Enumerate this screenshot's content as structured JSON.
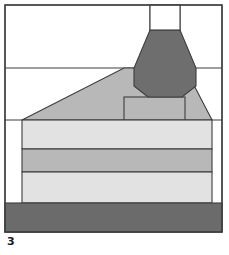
{
  "figure": {
    "label": "3",
    "caption_label": "3",
    "type": "cross-section-schematic",
    "width": 229,
    "height": 255,
    "background_color": "#ffffff"
  },
  "colors": {
    "stroke": "#3d3d3d",
    "core_dark": "#6e6e6e",
    "mid_gray": "#b8b8b8",
    "light_gray": "#e2e2e2",
    "base_dark": "#6b6b6b",
    "white": "#ffffff",
    "label_text": "#1a1a1a"
  },
  "frame": {
    "name": "outer-frame",
    "x": 5,
    "y": 5,
    "width": 217,
    "height": 227,
    "fill": "#ffffff",
    "stroke": "#3d3d3d",
    "stroke_width": 1.2
  },
  "guides": {
    "horizontal": [
      {
        "name": "upper-divider",
        "y": 68,
        "x1": 5,
        "x2": 222
      },
      {
        "name": "mid-divider",
        "y": 120,
        "x1": 5,
        "x2": 222
      }
    ],
    "vertical": [
      {
        "name": "core-left-guide",
        "x": 150,
        "y1": 5,
        "y2": 120
      },
      {
        "name": "core-right-guide",
        "x": 180,
        "y1": 5,
        "y2": 120
      },
      {
        "name": "chimney-left-edge",
        "x": 124,
        "y1": 97,
        "y2": 120
      },
      {
        "name": "chimney-right-edge",
        "x": 185,
        "y1": 97,
        "y2": 120
      }
    ]
  },
  "shapes": [
    {
      "name": "top-notch-box",
      "kind": "rect",
      "x": 150,
      "y": 5,
      "width": 30,
      "height": 25,
      "fill": "#ffffff",
      "stroke": "#3d3d3d"
    },
    {
      "name": "core-hexagon",
      "kind": "polygon",
      "points": "150,30 180,30 196,68 196,86 182,97 148,97 134,86 134,68",
      "fill": "#6e6e6e",
      "stroke": "#3d3d3d"
    },
    {
      "name": "slope-mass",
      "kind": "polygon",
      "points": "22,120 124,68 185,68 212,120",
      "fill": "#b8b8b8",
      "stroke": "#3d3d3d"
    },
    {
      "name": "chimney-box",
      "kind": "rect",
      "x": 124,
      "y": 97,
      "width": 61,
      "height": 23,
      "fill": "#b8b8b8",
      "stroke": "#3d3d3d"
    },
    {
      "name": "layer-band-1-light",
      "kind": "rect",
      "x": 22,
      "y": 120,
      "width": 190,
      "height": 29,
      "fill": "#e2e2e2",
      "stroke": "#3d3d3d"
    },
    {
      "name": "layer-band-2-medium",
      "kind": "rect",
      "x": 22,
      "y": 149,
      "width": 190,
      "height": 23,
      "fill": "#b8b8b8",
      "stroke": "#3d3d3d"
    },
    {
      "name": "layer-band-3-light",
      "kind": "rect",
      "x": 22,
      "y": 172,
      "width": 190,
      "height": 31,
      "fill": "#e2e2e2",
      "stroke": "#3d3d3d"
    },
    {
      "name": "base-slab-dark",
      "kind": "rect",
      "x": 5,
      "y": 203,
      "width": 217,
      "height": 29,
      "fill": "#6b6b6b",
      "stroke": "#3d3d3d"
    }
  ]
}
